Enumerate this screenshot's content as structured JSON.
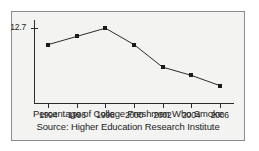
{
  "chart_data": {
    "type": "line",
    "title": "Percentage of College Freshmen Who Smoke",
    "source": "Source: Higher Education Research Institute",
    "xlabel": "",
    "ylabel": "",
    "categories": [
      "1994",
      "1996",
      "1998",
      "2000",
      "2002",
      "2004",
      "2006"
    ],
    "x": [
      1994,
      1996,
      1998,
      2000,
      2002,
      2004,
      2006
    ],
    "values": [
      11.9,
      12.3,
      12.7,
      11.9,
      10.8,
      10.4,
      9.9
    ],
    "series": [
      {
        "name": "Percentage of college freshmen who smoke",
        "values": [
          11.9,
          12.3,
          12.7,
          11.9,
          10.8,
          10.4,
          9.9
        ]
      }
    ],
    "y_tick_labels": [
      "12.7"
    ],
    "y_tick_values": [
      12.7
    ],
    "ylim": [
      9.0,
      13.1
    ],
    "xlim": [
      1993,
      2007
    ],
    "grid": false,
    "legend": false,
    "marker": "square",
    "line_color": "#2b2b2b",
    "marker_color": "#1a1a1a",
    "background_color": "#f3f3f1",
    "border_color": "#8d8d8d"
  },
  "axes": {
    "y_ticks": [
      {
        "label": "12.7",
        "value": 12.7
      }
    ],
    "x_ticks": [
      {
        "label": "1994",
        "value": 1994
      },
      {
        "label": "1996",
        "value": 1996
      },
      {
        "label": "1998",
        "value": 1998
      },
      {
        "label": "2000",
        "value": 2000
      },
      {
        "label": "2002",
        "value": 2002
      },
      {
        "label": "2004",
        "value": 2004
      },
      {
        "label": "2006",
        "value": 2006
      }
    ]
  },
  "captions": {
    "line1": "Percentage of College Freshmen Who Smoke",
    "line2": "Source: Higher Education Research Institute"
  }
}
